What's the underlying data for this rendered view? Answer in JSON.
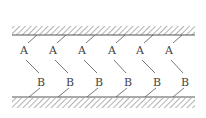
{
  "diagram": {
    "top_wall": {
      "y": 35,
      "x1": 12,
      "x2": 195,
      "hatch_side": "above"
    },
    "bottom_wall": {
      "y": 97,
      "x1": 12,
      "x2": 195,
      "hatch_side": "below"
    },
    "line_color": "#555555",
    "pairs": [
      {
        "a_label": "A",
        "b_label": "B",
        "ax": 24,
        "ay": 50,
        "bx": 41,
        "by": 82
      },
      {
        "a_label": "A",
        "b_label": "B",
        "ax": 53,
        "ay": 50,
        "bx": 70,
        "by": 82
      },
      {
        "a_label": "A",
        "b_label": "B",
        "ax": 82,
        "ay": 50,
        "bx": 99,
        "by": 82
      },
      {
        "a_label": "A",
        "b_label": "B",
        "ax": 112,
        "ay": 50,
        "bx": 128,
        "by": 82
      },
      {
        "a_label": "A",
        "b_label": "B",
        "ax": 140,
        "ay": 50,
        "bx": 157,
        "by": 82
      },
      {
        "a_label": "A",
        "b_label": "B",
        "ax": 169,
        "ay": 50,
        "bx": 185,
        "by": 82
      }
    ]
  }
}
